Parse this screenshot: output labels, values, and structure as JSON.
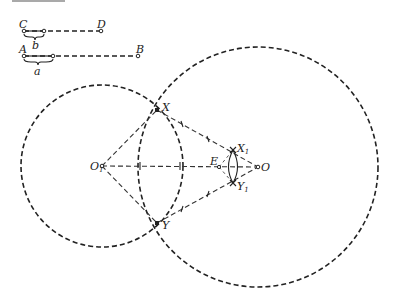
{
  "diagram": {
    "type": "geometric-construction",
    "segments": [
      {
        "id": "CD",
        "start_label": "C",
        "end_label": "D",
        "part_label": "b"
      },
      {
        "id": "AB",
        "start_label": "A",
        "end_label": "B",
        "part_label": "a"
      }
    ],
    "circles": [
      {
        "center_label": "O₁",
        "center_main": "O",
        "center_sub": "1"
      },
      {
        "center_label": "O",
        "center_main": "O",
        "center_sub": ""
      }
    ],
    "points": {
      "X": {
        "main": "X",
        "sub": ""
      },
      "Y": {
        "main": "Y",
        "sub": ""
      },
      "X1": {
        "main": "X",
        "sub": "1"
      },
      "Y1": {
        "main": "Y",
        "sub": "1"
      },
      "E": {
        "main": "E",
        "sub": ""
      }
    },
    "colors": {
      "ink": "#222222",
      "background": "#ffffff"
    }
  }
}
